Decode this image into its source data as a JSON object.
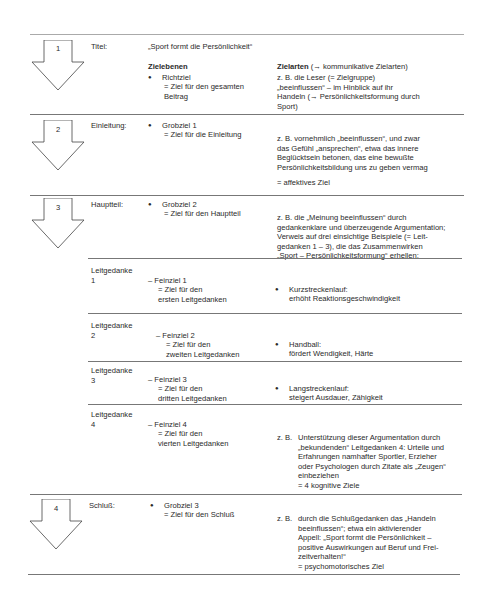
{
  "sections": [
    {
      "number": "1",
      "label": "Titel:",
      "title": "„Sport formt die Persönlichkeit“",
      "col_header_left": "Zielebenen",
      "col_header_right_bold": "Zielarten",
      "col_header_right_rest": " (→ kommunikative Zielarten)",
      "goal_name": "Richtziel",
      "goal_desc": "= Ziel für den gesamten\nBeitrag",
      "example": "z. B. die Leser (= Zielgruppe)\n„beeinflussen“ – im Hinblick auf ihr\nHandeln (→ Persönlichkeitsformung durch\nSport)"
    },
    {
      "number": "2",
      "label": "Einleitung:",
      "goal_name": "Grobziel 1",
      "goal_desc": "= Ziel für die Einleitung",
      "example": "z. B. vornehmlich „beeinflussen“, und zwar\ndas Gefühl „ansprechen“, etwa das innere\nBeglücktsein betonen, das eine bewußte\nPersönlichkeitsbildung uns zu geben vermag",
      "result": "= affektives Ziel"
    },
    {
      "number": "3",
      "label": "Hauptteil:",
      "goal_name": "Grobziel 2",
      "goal_desc": "= Ziel für den Hauptteil",
      "example": "z. B. die „Meinung beeinflussen“ durch\ngedankenklare und überzeugende Argumentation;\nVerweis auf drei einsichtige Beispiele (= Leit-\ngedanken 1 – 3), die das Zusammenwirken\n„Sport – Persönlichkeitsformung“ erhellen:"
    },
    {
      "number": "4",
      "label": "Schluß:",
      "goal_name": "Grobziel 3",
      "goal_desc": "= Ziel für den Schluß",
      "example_prefix": "z. B.",
      "example": "durch die Schlußgedanken das „Handeln\nbeeinflussen“; etwa ein aktivierender\nAppell: „Sport formt die Persönlichkeit –\npositive Auswirkungen auf Beruf und Frei-\nzeitverhalten!“",
      "result": "= psychomotorisches Ziel"
    }
  ],
  "leitgedanken": [
    {
      "label": "Leitgedanke\n1",
      "feinziel": "– Feinziel 1",
      "desc": "= Ziel für den\n   ersten Leitgedanken",
      "example_title": "Kurzstreckenlauf:",
      "example_text": "erhöht Reaktionsgeschwindigkeit"
    },
    {
      "label": "Leitgedanke\n2",
      "feinziel": "– Feinziel 2",
      "desc": "= Ziel für den\n   zweiten Leitgedanken",
      "example_title": "Handball:",
      "example_text": "fördert Wendigkeit, Härte"
    },
    {
      "label": "Leitgedanke\n3",
      "feinziel": "– Feinziel 3",
      "desc": "= Ziel für den\n   dritten Leitgedanken",
      "example_title": "Langstreckenlauf:",
      "example_text": "steigert Ausdauer, Zähigkeit"
    },
    {
      "label": "Leitgedanke\n4",
      "feinziel": "– Feinziel 4",
      "desc": "= Ziel für den\n   vierten Leitgedanken",
      "example_prefix": "z. B.",
      "example": "Unterstützung dieser Argumentation durch\n„bekundenden“ Leitgedanken 4: Urteile und\nErfahrungen namhafter Sportler, Erzieher\noder Psychologen durch Zitate als „Zeugen“\neinbeziehen",
      "result": "= 4 kognitive Ziele"
    }
  ]
}
